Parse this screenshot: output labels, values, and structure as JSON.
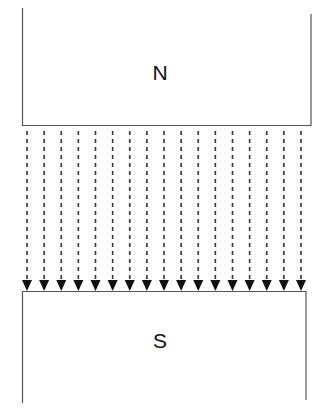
{
  "diagram": {
    "type": "magnetic-field-between-poles",
    "north_pole": {
      "label": "N"
    },
    "south_pole": {
      "label": "S"
    },
    "field_lines": {
      "count": 17,
      "direction": "down",
      "style": "dashed",
      "from": "N",
      "to": "S"
    },
    "colors": {
      "line": "#333333",
      "text": "#111111",
      "background": "#ffffff"
    }
  }
}
